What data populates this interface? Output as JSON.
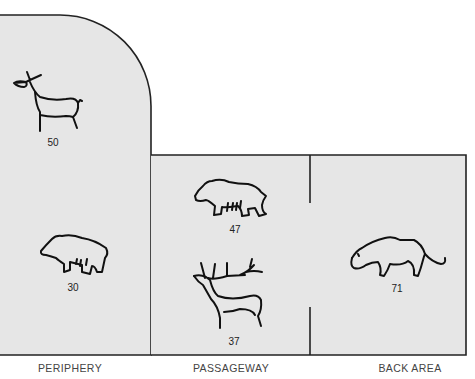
{
  "colors": {
    "area_fill": "#e6e6e6",
    "outline": "#222222",
    "page": "#ffffff"
  },
  "zones": [
    {
      "id": "periphery",
      "label": "PERIPHERY"
    },
    {
      "id": "passageway",
      "label": "PASSAGEWAY"
    },
    {
      "id": "back_area",
      "label": "BACK AREA"
    }
  ],
  "figures": [
    {
      "animal": "ibex",
      "zone": "periphery",
      "count": "50"
    },
    {
      "animal": "bear",
      "zone": "periphery",
      "count": "30"
    },
    {
      "animal": "bison",
      "zone": "passageway",
      "count": "47"
    },
    {
      "animal": "stag",
      "zone": "passageway",
      "count": "37"
    },
    {
      "animal": "lion",
      "zone": "back_area",
      "count": "71"
    }
  ]
}
